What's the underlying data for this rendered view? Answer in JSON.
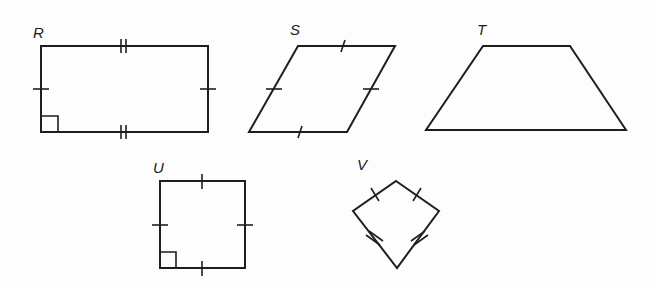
{
  "figure": {
    "type": "quadrilateral-classification",
    "shapes": [
      {
        "label": "R",
        "kind": "rectangle",
        "marks": "opposite sides congruent (single ticks on vertical sides, double ticks on horizontal sides), right angle marker"
      },
      {
        "label": "S",
        "kind": "rhombus",
        "marks": "all four sides single tick"
      },
      {
        "label": "T",
        "kind": "trapezoid",
        "marks": "none"
      },
      {
        "label": "U",
        "kind": "square",
        "marks": "all four sides single tick, right angle marker"
      },
      {
        "label": "V",
        "kind": "kite",
        "marks": "upper sides single tick, lower sides double tick"
      }
    ]
  },
  "labels": {
    "R": "R",
    "S": "S",
    "T": "T",
    "U": "U",
    "V": "V"
  },
  "colors": {
    "stroke": "#1e1e1e",
    "background": "#fdfdfd"
  }
}
